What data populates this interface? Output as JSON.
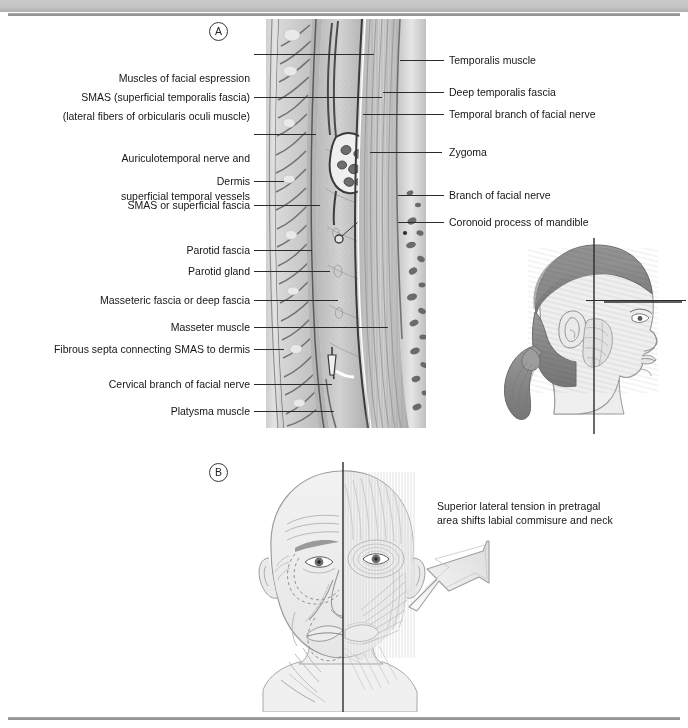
{
  "header": {
    "running_text": "",
    "band_color": "#c4c4c4",
    "rule_color": "#9a9a9a"
  },
  "figure": {
    "panel_a_marker": "A",
    "panel_b_marker": "B",
    "background": "#ffffff",
    "ink_color": "#151515"
  },
  "panel_a": {
    "title": "Cross-section of the lateral face showing SMAS and fascial layers",
    "left_labels": [
      {
        "id": "muscles-of-facial-expression",
        "line1": "Muscles of facial espression",
        "line2": "(lateral fibers of orbicularis oculi muscle)"
      },
      {
        "id": "smas-superficial-temporalis-fascia",
        "line1": "SMAS (superficial temporalis fascia)",
        "line2": ""
      },
      {
        "id": "auriculotemporal-nerve",
        "line1": "Auriculotemporal nerve and",
        "line2": "superficial temporal vessels"
      },
      {
        "id": "dermis",
        "line1": "Dermis",
        "line2": ""
      },
      {
        "id": "smas-or-superficial-fascia",
        "line1": "SMAS or superficial fascia",
        "line2": ""
      },
      {
        "id": "parotid-fascia",
        "line1": "Parotid fascia",
        "line2": ""
      },
      {
        "id": "parotid-gland",
        "line1": "Parotid gland",
        "line2": ""
      },
      {
        "id": "masseteric-fascia",
        "line1": "Masseteric fascia or deep fascia",
        "line2": ""
      },
      {
        "id": "masseter-muscle",
        "line1": "Masseter muscle",
        "line2": ""
      },
      {
        "id": "fibrous-septa",
        "line1": "Fibrous septa connecting SMAS to dermis",
        "line2": ""
      },
      {
        "id": "cervical-branch-of-facial-nerve",
        "line1": "Cervical branch of facial nerve",
        "line2": ""
      },
      {
        "id": "platysma-muscle",
        "line1": "Platysma muscle",
        "line2": ""
      }
    ],
    "right_labels": [
      {
        "id": "temporalis-muscle",
        "text": "Temporalis muscle"
      },
      {
        "id": "deep-temporalis-fascia",
        "text": "Deep temporalis fascia"
      },
      {
        "id": "temporal-branch-of-facial-nerve",
        "text": "Temporal branch of facial nerve"
      },
      {
        "id": "zygoma",
        "text": "Zygoma"
      },
      {
        "id": "branch-of-facial-nerve",
        "text": "Branch of facial nerve"
      },
      {
        "id": "coronoid-process-of-mandible",
        "text": "Coronoid process of mandible"
      }
    ]
  },
  "panel_b": {
    "caption_line1": "Superior lateral tension in pretragal",
    "caption_line2": "area shifts labial commisure and neck",
    "arrow_direction": "up-right",
    "arrow_fill": "#e8e8e8"
  },
  "head_inset": {
    "description": "Lateral profile of a woman with ponytail showing the plane of section",
    "hair_color": "#8d8d8d",
    "skin_color": "#ededed"
  }
}
